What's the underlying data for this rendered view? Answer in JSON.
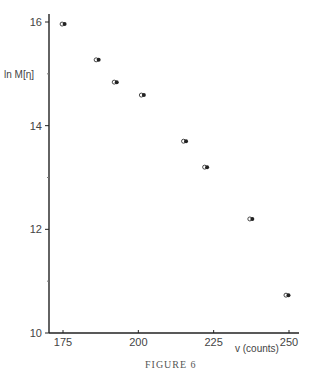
{
  "chart_data": {
    "type": "scatter",
    "title": "",
    "caption": "FIGURE 6",
    "xlabel": "v (counts)",
    "ylabel": "ln M[η]",
    "xlim": [
      170,
      253
    ],
    "ylim": [
      10,
      16.3
    ],
    "xticks": [
      175,
      200,
      225,
      250
    ],
    "yticks": [
      10,
      12,
      14,
      16
    ],
    "grid": false,
    "legend": null,
    "marker_style": "paired open and filled circles",
    "x": [
      174.7,
      186,
      192,
      201,
      215,
      222,
      237,
      249
    ],
    "y": [
      15.96,
      15.27,
      14.84,
      14.59,
      13.7,
      13.2,
      12.2,
      10.73
    ],
    "series": [
      {
        "name": "open circles",
        "x": [
          174.7,
          186,
          192,
          201,
          215,
          222,
          237,
          249
        ],
        "y": [
          15.96,
          15.27,
          14.84,
          14.59,
          13.7,
          13.2,
          12.2,
          10.73
        ]
      },
      {
        "name": "filled circles",
        "x": [
          174.7,
          186,
          192.3,
          201.3,
          215.3,
          222.3,
          237.5,
          249.4
        ],
        "y": [
          15.96,
          15.27,
          14.84,
          14.59,
          13.7,
          13.2,
          12.2,
          10.73
        ]
      }
    ]
  },
  "labels": {
    "ylabel": "ln M[η]",
    "xlabel": "v (counts)",
    "caption": "FIGURE 6",
    "xticks": [
      "175",
      "200",
      "225",
      "250"
    ],
    "yticks": [
      "16",
      "14",
      "12",
      "10"
    ]
  }
}
